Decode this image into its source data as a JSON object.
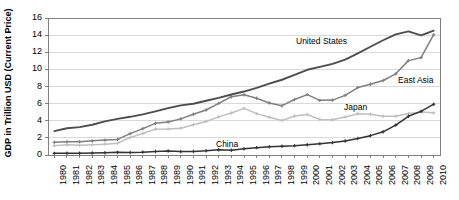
{
  "chart_data": {
    "type": "line",
    "title": "",
    "xlabel": "",
    "ylabel": "GDP in Trillion USD (Current Price)",
    "ylim": [
      0,
      16
    ],
    "yticks": [
      0,
      2,
      4,
      6,
      8,
      10,
      12,
      14,
      16
    ],
    "grid": true,
    "legend_position": "inline-labels",
    "categories": [
      "1980",
      "1981",
      "1982",
      "1983",
      "1984",
      "1985",
      "1986",
      "1987",
      "1988",
      "1989",
      "1990",
      "1991",
      "1992",
      "1993",
      "1994",
      "1995",
      "1996",
      "1997",
      "1998",
      "1999",
      "2000",
      "2001",
      "2002",
      "2003",
      "2004",
      "2005",
      "2006",
      "2007",
      "2008",
      "2009",
      "2010"
    ],
    "series": [
      {
        "name": "United States",
        "color": "#4d4d4d",
        "marker": "none",
        "values": [
          2.79,
          3.13,
          3.26,
          3.53,
          3.93,
          4.22,
          4.46,
          4.74,
          5.1,
          5.48,
          5.8,
          5.99,
          6.34,
          6.67,
          7.07,
          7.41,
          7.84,
          8.33,
          8.79,
          9.35,
          9.95,
          10.29,
          10.64,
          11.14,
          11.87,
          12.64,
          13.4,
          14.08,
          14.44,
          13.97,
          14.52
        ]
      },
      {
        "name": "East Asia",
        "color": "#7f7f7f",
        "marker": "plus",
        "values": [
          1.49,
          1.56,
          1.56,
          1.65,
          1.74,
          1.82,
          2.5,
          3.08,
          3.7,
          3.86,
          4.22,
          4.76,
          5.26,
          6.03,
          6.8,
          7.03,
          6.62,
          6.08,
          5.76,
          6.48,
          7.05,
          6.38,
          6.41,
          6.96,
          7.88,
          8.26,
          8.7,
          9.48,
          11.02,
          11.37,
          14.05
        ]
      },
      {
        "name": "Japan",
        "color": "#bfbfbf",
        "marker": "plus",
        "values": [
          1.09,
          1.2,
          1.13,
          1.21,
          1.27,
          1.38,
          2.05,
          2.51,
          3.02,
          3.05,
          3.13,
          3.54,
          3.91,
          4.45,
          4.91,
          5.45,
          4.83,
          4.41,
          4.03,
          4.56,
          4.73,
          4.16,
          4.12,
          4.44,
          4.82,
          4.76,
          4.53,
          4.52,
          4.85,
          5.03,
          4.92
        ]
      },
      {
        "name": "China",
        "color": "#333333",
        "marker": "plus",
        "values": [
          0.19,
          0.2,
          0.21,
          0.23,
          0.26,
          0.31,
          0.3,
          0.33,
          0.41,
          0.46,
          0.4,
          0.41,
          0.49,
          0.62,
          0.56,
          0.73,
          0.86,
          0.96,
          1.03,
          1.09,
          1.2,
          1.32,
          1.45,
          1.64,
          1.93,
          2.26,
          2.71,
          3.49,
          4.52,
          5.1,
          5.93
        ]
      }
    ]
  },
  "axes": {
    "y_tick_labels": [
      "0",
      "2",
      "4",
      "6",
      "8",
      "10",
      "12",
      "14",
      "16"
    ],
    "x_tick_labels": [
      "1980",
      "1981",
      "1982",
      "1983",
      "1984",
      "1985",
      "1986",
      "1987",
      "1988",
      "1989",
      "1990",
      "1991",
      "1992",
      "1993",
      "1994",
      "1995",
      "1996",
      "1997",
      "1998",
      "1999",
      "2000",
      "2001",
      "2002",
      "2003",
      "2004",
      "2005",
      "2006",
      "2007",
      "2008",
      "2009",
      "2010"
    ]
  },
  "annotations": [
    {
      "name": "united-states",
      "text": "United States"
    },
    {
      "name": "east-asia",
      "text": "East Asia"
    },
    {
      "name": "japan",
      "text": "Japan"
    },
    {
      "name": "china",
      "text": "China"
    }
  ],
  "colors": {
    "plot_border": "#808080",
    "gridline": "#d9d9d9",
    "background": "#ffffff"
  }
}
